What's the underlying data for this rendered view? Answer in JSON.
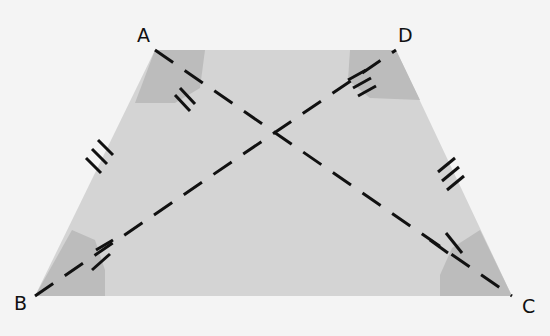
{
  "diagram": {
    "labels": {
      "A": "A",
      "B": "B",
      "C": "C",
      "D": "D"
    },
    "vertices": {
      "A": [
        155,
        50
      ],
      "D": [
        396,
        50
      ],
      "B": [
        35,
        296
      ],
      "C": [
        512,
        296
      ]
    },
    "diagonals": [
      "AC",
      "BD"
    ],
    "equal_legs": [
      "AB",
      "DC"
    ],
    "leg_tick_count": 3,
    "colors": {
      "background": "#f4f4f4",
      "trapezoid_fill": "#d4d4d4",
      "angle_shade": "#bcbcbc",
      "stroke": "#111111"
    }
  }
}
